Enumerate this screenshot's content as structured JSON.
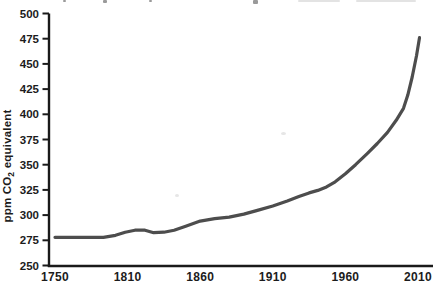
{
  "figure": {
    "background": "#ffffff",
    "cropped_top_caption": {
      "note": "partially cropped text line at top edge, illegible",
      "fragments": [
        {
          "x": 63,
          "y": 0,
          "w": 3,
          "h": 2,
          "light": false
        },
        {
          "x": 103,
          "y": 0,
          "w": 4,
          "h": 3,
          "light": false
        },
        {
          "x": 149,
          "y": 0,
          "w": 3,
          "h": 2,
          "light": false
        },
        {
          "x": 253,
          "y": 0,
          "w": 5,
          "h": 4,
          "light": false
        },
        {
          "x": 298,
          "y": 0,
          "w": 42,
          "h": 2,
          "light": true
        },
        {
          "x": 356,
          "y": 0,
          "w": 60,
          "h": 2,
          "light": true
        }
      ]
    },
    "scan_artifacts": [
      {
        "x": 175,
        "y": 194,
        "w": 4,
        "h": 3
      },
      {
        "x": 281,
        "y": 132,
        "w": 5,
        "h": 3
      }
    ]
  },
  "chart_data": {
    "type": "line",
    "title": "",
    "xlabel": "",
    "ylabel": {
      "prefix": "ppm CO",
      "subscript": "2",
      "suffix": " equivalent"
    },
    "x_ticks": [
      "1750",
      "1810",
      "1860",
      "1910",
      "1960",
      "2010"
    ],
    "x_tick_years": [
      1750,
      1810,
      1860,
      1910,
      1960,
      2010
    ],
    "y_ticks": [
      250,
      275,
      300,
      325,
      350,
      375,
      400,
      425,
      450,
      475,
      500
    ],
    "ylim": [
      250,
      500
    ],
    "grid": false,
    "legend": null,
    "line_color": "#4d4d4d",
    "axis_color": "#1a1a1a",
    "series": [
      {
        "name": "greenhouse-gas concentration",
        "points": [
          {
            "year": 1750,
            "ppm": 278
          },
          {
            "year": 1775,
            "ppm": 278
          },
          {
            "year": 1790,
            "ppm": 278
          },
          {
            "year": 1800,
            "ppm": 280
          },
          {
            "year": 1808,
            "ppm": 283
          },
          {
            "year": 1815,
            "ppm": 285
          },
          {
            "year": 1822,
            "ppm": 285
          },
          {
            "year": 1828,
            "ppm": 282.5
          },
          {
            "year": 1835,
            "ppm": 283
          },
          {
            "year": 1842,
            "ppm": 285
          },
          {
            "year": 1850,
            "ppm": 289
          },
          {
            "year": 1860,
            "ppm": 294
          },
          {
            "year": 1870,
            "ppm": 296.5
          },
          {
            "year": 1880,
            "ppm": 298
          },
          {
            "year": 1890,
            "ppm": 301
          },
          {
            "year": 1900,
            "ppm": 305
          },
          {
            "year": 1910,
            "ppm": 309
          },
          {
            "year": 1920,
            "ppm": 314
          },
          {
            "year": 1928,
            "ppm": 318.5
          },
          {
            "year": 1935,
            "ppm": 322
          },
          {
            "year": 1941,
            "ppm": 324.5
          },
          {
            "year": 1947,
            "ppm": 328
          },
          {
            "year": 1953,
            "ppm": 333
          },
          {
            "year": 1960,
            "ppm": 341
          },
          {
            "year": 1967,
            "ppm": 350
          },
          {
            "year": 1975,
            "ppm": 361
          },
          {
            "year": 1982,
            "ppm": 371
          },
          {
            "year": 1989,
            "ppm": 382
          },
          {
            "year": 1995,
            "ppm": 394
          },
          {
            "year": 2000,
            "ppm": 406
          },
          {
            "year": 2003,
            "ppm": 419
          },
          {
            "year": 2006,
            "ppm": 437
          },
          {
            "year": 2009,
            "ppm": 458
          },
          {
            "year": 2011,
            "ppm": 476
          }
        ]
      }
    ]
  }
}
